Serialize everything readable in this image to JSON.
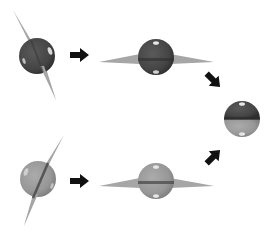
{
  "diagram": {
    "colors": {
      "background": "#ffffff",
      "dark_sphere": "#4a4a4a",
      "dark_sphere_edge": "#2e2e2e",
      "light_sphere": "#9a9a9a",
      "light_sphere_edge": "#7e7e7e",
      "wedge": "#a6a6a6",
      "band_dark": "#3a3a3a",
      "highlight": "#e6e6e6",
      "arrow": "#111111"
    },
    "nodes": [
      {
        "id": "dark-tilted",
        "label": "",
        "shade": "dark",
        "orientation": "tilted"
      },
      {
        "id": "dark-horizontal",
        "label": "",
        "shade": "dark",
        "orientation": "horizontal"
      },
      {
        "id": "light-tilted",
        "label": "",
        "shade": "light",
        "orientation": "tilted"
      },
      {
        "id": "light-horizontal",
        "label": "",
        "shade": "light",
        "orientation": "horizontal"
      },
      {
        "id": "combined",
        "label": "",
        "shade": "half-dark-half-light",
        "orientation": "horizontal"
      }
    ],
    "edges": [
      {
        "from": "dark-tilted",
        "to": "dark-horizontal",
        "direction": "right"
      },
      {
        "from": "light-tilted",
        "to": "light-horizontal",
        "direction": "right"
      },
      {
        "from": "dark-horizontal",
        "to": "combined",
        "direction": "down-right"
      },
      {
        "from": "light-horizontal",
        "to": "combined",
        "direction": "up-right"
      }
    ]
  }
}
